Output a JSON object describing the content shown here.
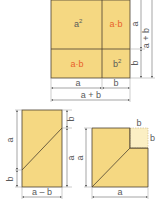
{
  "colors": {
    "fill": "#f5d882",
    "fill_light": "#fbefc4",
    "stroke": "#4a4030",
    "dim_line": "#6a6a6a",
    "text": "#5a5a5a",
    "highlight_text": "#e8622a"
  },
  "top_figure": {
    "cells": {
      "a_squared": {
        "base": "a",
        "exp": "2"
      },
      "ab_top": "a·b",
      "ab_bottom": "a·b",
      "b_squared": {
        "base": "b",
        "exp": "2"
      }
    },
    "dimensions": {
      "bottom_a": "a",
      "bottom_b": "b",
      "bottom_total": "a + b",
      "right_a": "a",
      "right_b": "b",
      "right_total": "a + b"
    }
  },
  "bottom_left_figure": {
    "dimensions": {
      "left_a": "a",
      "left_b": "b",
      "right_b": "b",
      "right_a": "a",
      "bottom": "a – b"
    }
  },
  "bottom_right_figure": {
    "dimensions": {
      "top_b": "b",
      "right_b": "b",
      "left_a": "a",
      "bottom_a": "a"
    }
  }
}
